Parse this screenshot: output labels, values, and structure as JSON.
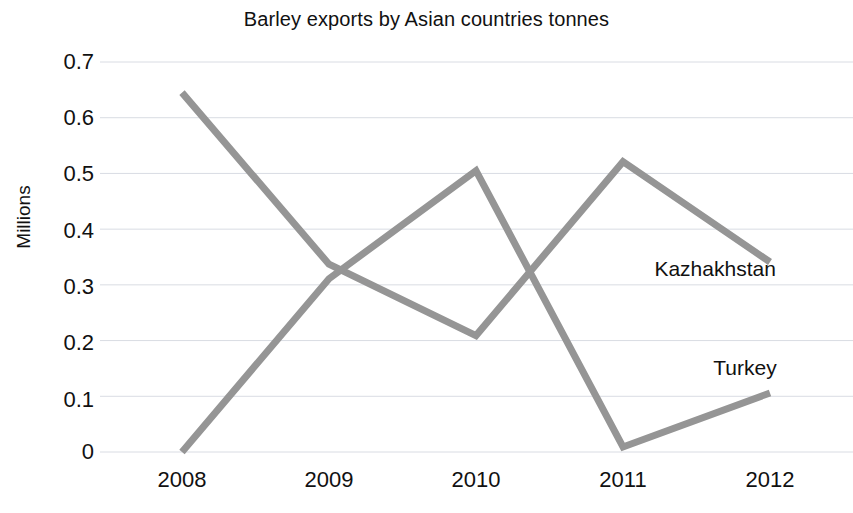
{
  "chart_data": {
    "type": "line",
    "title": "Barley exports by Asian countries tonnes",
    "xlabel": "",
    "ylabel": "Millions",
    "categories": [
      "2008",
      "2009",
      "2010",
      "2011",
      "2012"
    ],
    "x": [
      2008,
      2009,
      2010,
      2011,
      2012
    ],
    "ylim": [
      0,
      0.7
    ],
    "yticks": [
      "0",
      "0.1",
      "0.2",
      "0.3",
      "0.4",
      "0.5",
      "0.6",
      "0.7"
    ],
    "ytick_values": [
      0,
      0.1,
      0.2,
      0.3,
      0.4,
      0.5,
      0.6,
      0.7
    ],
    "grid": true,
    "grid_axis": "y",
    "legend_position": "inline-annotations",
    "series": [
      {
        "name": "Kazhakhstan",
        "color": "#959595",
        "values": [
          0.645,
          0.337,
          0.209,
          0.521,
          0.341
        ],
        "label_x": 2011.35,
        "label_y": 0.325
      },
      {
        "name": "Turkey",
        "color": "#959595",
        "values": [
          0.0,
          0.311,
          0.505,
          0.009,
          0.106
        ],
        "label_x": 2011.75,
        "label_y": 0.148
      }
    ],
    "annotations": [
      {
        "text": "Kazhakhstan"
      },
      {
        "text": "Turkey"
      }
    ]
  },
  "colors": {
    "line": "#959595",
    "gridline": "#d9dce3",
    "text": "#111111",
    "background": "#ffffff"
  }
}
